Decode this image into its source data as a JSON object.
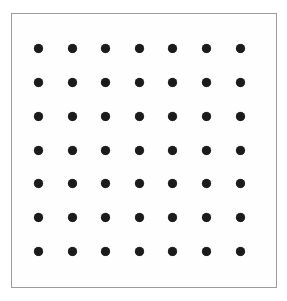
{
  "figure": {
    "kind": "dot-grid-pattern",
    "canvas_width": 287,
    "canvas_height": 301,
    "background_color": "#ffffff"
  },
  "frame": {
    "name": "border-rectangle",
    "x": 11,
    "y": 13,
    "width": 266,
    "height": 275,
    "stroke_color": "#9d9d9d",
    "stroke_width": 1,
    "fill_color": "#fefefe"
  },
  "chart_data": {
    "type": "scatter",
    "title": "",
    "subtitle": "",
    "xlabel": "",
    "ylabel": "",
    "grid": false,
    "legend": null,
    "rows": 7,
    "columns": 7,
    "point_count": 49,
    "point_color": "#1b1b1b",
    "point_diameter": 9,
    "column_spacing": 33.7,
    "row_spacing": 33.8,
    "xlim": [
      11,
      277
    ],
    "ylim": [
      13,
      288
    ],
    "x": [
      38,
      72,
      105,
      139,
      172,
      206,
      240
    ],
    "y": [
      48,
      82,
      116,
      150,
      183,
      217,
      251
    ],
    "points": [
      {
        "x": 38,
        "y": 48
      },
      {
        "x": 72,
        "y": 48
      },
      {
        "x": 105,
        "y": 48
      },
      {
        "x": 139,
        "y": 48
      },
      {
        "x": 172,
        "y": 48
      },
      {
        "x": 206,
        "y": 48
      },
      {
        "x": 240,
        "y": 48
      },
      {
        "x": 38,
        "y": 82
      },
      {
        "x": 72,
        "y": 82
      },
      {
        "x": 105,
        "y": 82
      },
      {
        "x": 139,
        "y": 82
      },
      {
        "x": 172,
        "y": 82
      },
      {
        "x": 206,
        "y": 82
      },
      {
        "x": 240,
        "y": 82
      },
      {
        "x": 38,
        "y": 116
      },
      {
        "x": 72,
        "y": 116
      },
      {
        "x": 105,
        "y": 116
      },
      {
        "x": 139,
        "y": 116
      },
      {
        "x": 172,
        "y": 116
      },
      {
        "x": 206,
        "y": 116
      },
      {
        "x": 240,
        "y": 116
      },
      {
        "x": 38,
        "y": 150
      },
      {
        "x": 72,
        "y": 150
      },
      {
        "x": 105,
        "y": 150
      },
      {
        "x": 139,
        "y": 150
      },
      {
        "x": 172,
        "y": 150
      },
      {
        "x": 206,
        "y": 150
      },
      {
        "x": 240,
        "y": 150
      },
      {
        "x": 38,
        "y": 183
      },
      {
        "x": 72,
        "y": 183
      },
      {
        "x": 105,
        "y": 183
      },
      {
        "x": 139,
        "y": 183
      },
      {
        "x": 172,
        "y": 183
      },
      {
        "x": 206,
        "y": 183
      },
      {
        "x": 240,
        "y": 183
      },
      {
        "x": 38,
        "y": 217
      },
      {
        "x": 72,
        "y": 217
      },
      {
        "x": 105,
        "y": 217
      },
      {
        "x": 139,
        "y": 217
      },
      {
        "x": 172,
        "y": 217
      },
      {
        "x": 206,
        "y": 217
      },
      {
        "x": 240,
        "y": 217
      },
      {
        "x": 38,
        "y": 251
      },
      {
        "x": 72,
        "y": 251
      },
      {
        "x": 105,
        "y": 251
      },
      {
        "x": 139,
        "y": 251
      },
      {
        "x": 172,
        "y": 251
      },
      {
        "x": 206,
        "y": 251
      },
      {
        "x": 240,
        "y": 251
      }
    ]
  }
}
